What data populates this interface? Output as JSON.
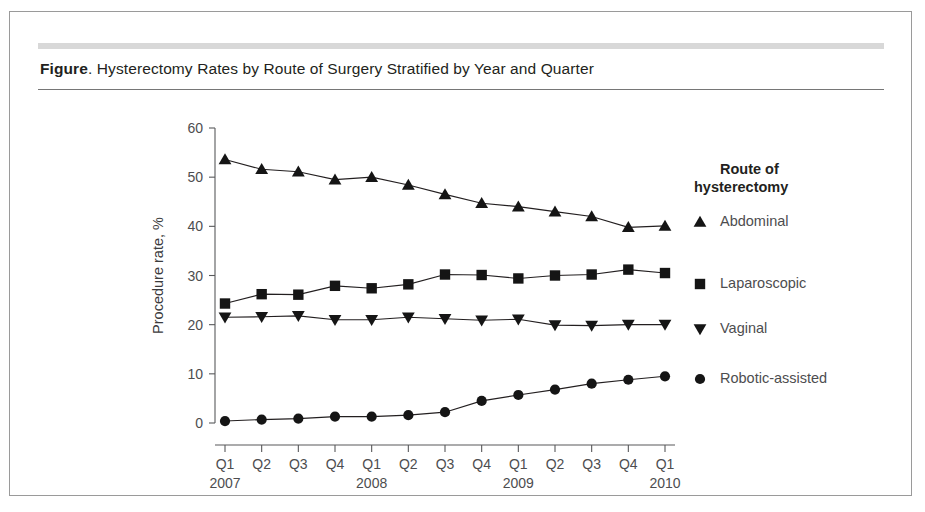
{
  "figure": {
    "label": "Figure",
    "title_rest": ". Hysterectomy Rates by Route of Surgery Stratified by Year and Quarter"
  },
  "chart_data": {
    "type": "line",
    "title": "Hysterectomy Rates by Route of Surgery Stratified by Year and Quarter",
    "xlabel": "",
    "ylabel": "Procedure rate, %",
    "ylim": [
      0,
      60
    ],
    "yticks": [
      0,
      10,
      20,
      30,
      40,
      50,
      60
    ],
    "grid": false,
    "legend_position": "right",
    "legend_title_line1": "Route of",
    "legend_title_line2": "hysterectomy",
    "categories": [
      "Q1",
      "Q2",
      "Q3",
      "Q4",
      "Q1",
      "Q2",
      "Q3",
      "Q4",
      "Q1",
      "Q2",
      "Q3",
      "Q4",
      "Q1"
    ],
    "year_groups": [
      {
        "label": "2007",
        "start_index": 0
      },
      {
        "label": "2008",
        "start_index": 4
      },
      {
        "label": "2009",
        "start_index": 8
      },
      {
        "label": "2010",
        "start_index": 12
      }
    ],
    "series": [
      {
        "name": "Abdominal",
        "marker": "triangle-up",
        "color": "#151515",
        "values": [
          53.6,
          51.6,
          51.1,
          49.5,
          50.0,
          48.4,
          46.5,
          44.7,
          44.0,
          43.0,
          42.0,
          39.8,
          40.1
        ]
      },
      {
        "name": "Laparoscopic",
        "marker": "square",
        "color": "#151515",
        "values": [
          24.3,
          26.2,
          26.1,
          27.9,
          27.4,
          28.2,
          30.2,
          30.1,
          29.4,
          30.0,
          30.2,
          31.2,
          30.5
        ]
      },
      {
        "name": "Vaginal",
        "marker": "triangle-down",
        "color": "#151515",
        "values": [
          21.5,
          21.6,
          21.8,
          21.0,
          21.0,
          21.5,
          21.2,
          20.9,
          21.1,
          19.9,
          19.8,
          20.0,
          20.0
        ]
      },
      {
        "name": "Robotic-assisted",
        "marker": "circle",
        "color": "#151515",
        "values": [
          0.4,
          0.7,
          0.9,
          1.3,
          1.3,
          1.6,
          2.2,
          4.5,
          5.7,
          6.8,
          8.0,
          8.8,
          9.5
        ]
      }
    ]
  }
}
